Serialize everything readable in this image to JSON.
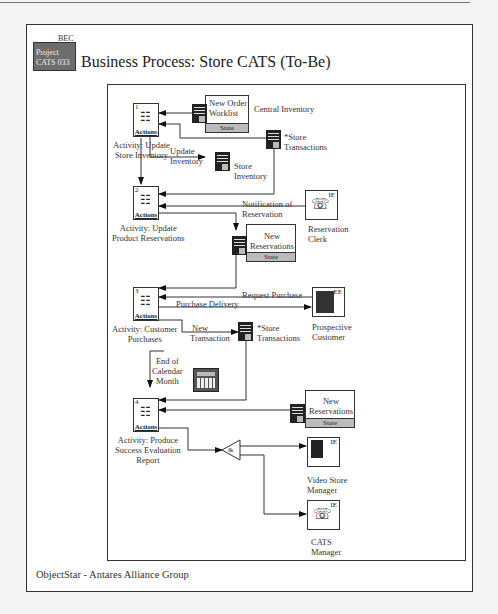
{
  "header": {
    "folder_tab": "BEC",
    "folder_lines": [
      "Project",
      "CATS 033"
    ],
    "title": "Business Process: Store CATS (To-Be)"
  },
  "footer": {
    "text": "ObjectStar - Antares Alliance Group"
  },
  "activities": [
    {
      "num": "1",
      "icon": "actions-icon",
      "label": "Actions",
      "caption": [
        "Activity: Update",
        "Store Inventory"
      ]
    },
    {
      "num": "2",
      "icon": "actions-icon",
      "label": "Actions",
      "caption": [
        "Activity: Update",
        "Product Reservations"
      ]
    },
    {
      "num": "3",
      "icon": "actions-icon",
      "label": "Actions",
      "caption": [
        "Activity: Customer",
        "Purchases"
      ]
    },
    {
      "num": "4",
      "icon": "actions-icon",
      "label": "Actions",
      "caption": [
        "Activity: Produce",
        "Success Evaluation",
        "Report"
      ]
    }
  ],
  "stores": {
    "new_order_worklist": {
      "lines": [
        "New Order",
        "Worklist"
      ],
      "state": "State"
    },
    "central_inventory": "Central Inventory",
    "store_transactions_1": [
      "*Store",
      "Transactions"
    ],
    "store_inventory": [
      "Store",
      "Inventory"
    ],
    "new_reservations_1": {
      "lines": [
        "New",
        "Reservations"
      ],
      "state": "State"
    },
    "store_transactions_2": [
      "*Store",
      "Transactions"
    ],
    "new_reservations_2": {
      "lines": [
        "New",
        "Reservations"
      ],
      "state": "State"
    }
  },
  "entities": {
    "reservation_clerk": {
      "tag": "IE",
      "lines": [
        "Reservation",
        "Clerk"
      ]
    },
    "prospective_customer": {
      "tag": "EE",
      "lines": [
        "Prospective",
        "Customer"
      ]
    },
    "video_store_manager": {
      "tag": "IE",
      "lines": [
        "Video Store",
        "Manager"
      ]
    },
    "cats_manager": {
      "tag": "IE",
      "lines": [
        "CATS",
        "Manager"
      ]
    }
  },
  "flows": {
    "update_inventory": [
      "Update",
      "Inventory"
    ],
    "notification": [
      "Notification of",
      "Reservation"
    ],
    "request_purchase": "Request Purchase",
    "purchase_delivery": "Purchase Delivery",
    "new_transaction": [
      "New",
      "Transaction"
    ],
    "end_of_month": [
      "End of",
      "Calendar",
      "Month"
    ],
    "and_gate": "&"
  }
}
